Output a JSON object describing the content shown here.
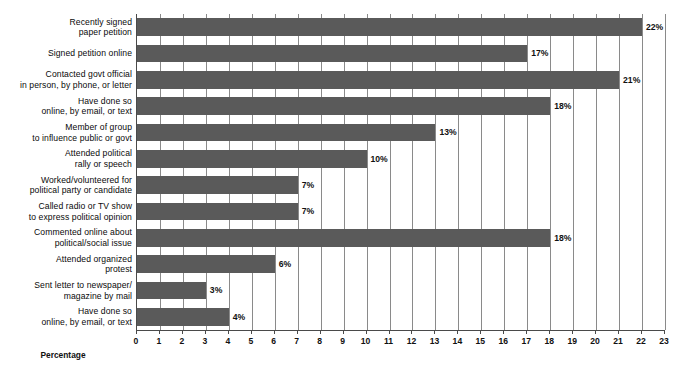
{
  "chart_data": {
    "type": "bar",
    "orientation": "horizontal",
    "title": "",
    "xlabel": "Percentage",
    "ylabel": "",
    "xlim": [
      0,
      23
    ],
    "xticks": [
      0,
      1,
      2,
      3,
      4,
      5,
      6,
      7,
      8,
      9,
      10,
      11,
      12,
      13,
      14,
      15,
      16,
      17,
      18,
      19,
      20,
      21,
      22,
      23
    ],
    "grid": true,
    "grid_axis": "x",
    "legend": "none",
    "bar_color": "#5a5a5a",
    "value_suffix": "%",
    "categories": [
      "Recently signed\npaper petition",
      "Signed petition online",
      "Contacted govt official\nin person, by phone, or letter",
      "Have done so\nonline, by email, or text",
      "Member of group\nto influence public or govt",
      "Attended political\nrally or speech",
      "Worked/volunteered for\npolitical party or candidate",
      "Called radio or TV show\nto express political opinion",
      "Commented online about\npolitical/social issue",
      "Attended organized\nprotest",
      "Sent letter to newspaper/\nmagazine by mail",
      "Have done so\nonline, by email, or text"
    ],
    "values": [
      22,
      17,
      21,
      18,
      13,
      10,
      7,
      7,
      18,
      6,
      3,
      4
    ],
    "value_labels": [
      "22%",
      "17%",
      "21%",
      "18%",
      "13%",
      "10%",
      "7%",
      "7%",
      "18%",
      "6%",
      "3%",
      "4%"
    ]
  }
}
